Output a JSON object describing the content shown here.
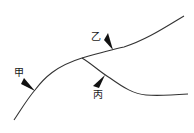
{
  "diagram": {
    "type": "line-diagram",
    "colors": {
      "line": "#333333",
      "marker": "#111111",
      "text": "#1a1a1a",
      "background": "#ffffff"
    },
    "lines": [
      {
        "id": "main-line",
        "description": "main curve rising from lower-left to upper-right"
      },
      {
        "id": "branch-line",
        "description": "branch diverging downward-right from main curve"
      }
    ],
    "markers": [
      {
        "id": "jia",
        "label": "甲",
        "position": "lower-left on main line"
      },
      {
        "id": "yi",
        "label": "乙",
        "position": "upper-middle on main line"
      },
      {
        "id": "bing",
        "label": "丙",
        "position": "on branch line"
      }
    ]
  }
}
